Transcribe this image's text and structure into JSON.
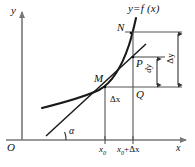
{
  "figure": {
    "background_color": "#ffffff",
    "ink_color": "#111111",
    "curve_color": "#1a1a1a",
    "guide_color": "#555555",
    "axis_color": "#777777"
  },
  "axes": {
    "origin_label": "O",
    "y_axis_label": "y",
    "x_axis_label": "x"
  },
  "curve": {
    "function_label": "y=f (x)",
    "function_label_parts": {
      "y": "y",
      "equals": "=",
      "f": "f",
      "open": "(",
      "x": "x",
      "close": ")"
    }
  },
  "points": {
    "M": "M",
    "N": "N",
    "P": "P",
    "Q": "Q"
  },
  "angle": {
    "alpha": "α"
  },
  "ticks": {
    "x0": "x₀",
    "x0_base": "x",
    "x0_sub": "0",
    "x0_plus_dx": "x₀+Δx",
    "x0_plus_dx_base": "x",
    "x0_plus_dx_sub": "0",
    "x0_plus_dx_rest": "+Δx"
  },
  "measures": {
    "delta_x": "Δx",
    "dy": "dy",
    "delta_y": "Δy"
  },
  "geometry": {
    "x0_px": 105,
    "x0_plus_dx_px": 133,
    "x_axis_y_px": 140,
    "y_axis_x_px": 22,
    "M_px": [
      105,
      87
    ],
    "N_px": [
      133,
      32
    ],
    "P_px": [
      133,
      57
    ],
    "Q_px": [
      133,
      87
    ]
  }
}
